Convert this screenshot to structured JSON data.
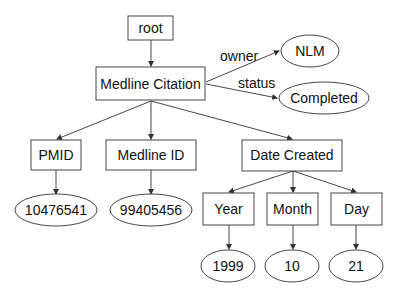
{
  "diagram": {
    "colors": {
      "stroke": "#333333",
      "text": "#111111",
      "background": "#ffffff"
    },
    "nodes": {
      "root": {
        "label": "root",
        "shape": "rect"
      },
      "medline_citation": {
        "label": "Medline Citation",
        "shape": "rect"
      },
      "nlm": {
        "label": "NLM",
        "shape": "ellipse"
      },
      "completed": {
        "label": "Completed",
        "shape": "ellipse"
      },
      "pmid": {
        "label": "PMID",
        "shape": "rect"
      },
      "medline_id": {
        "label": "Medline ID",
        "shape": "rect"
      },
      "date_created": {
        "label": "Date Created",
        "shape": "rect"
      },
      "pmid_value": {
        "label": "10476541",
        "shape": "ellipse"
      },
      "medline_id_value": {
        "label": "99405456",
        "shape": "ellipse"
      },
      "year": {
        "label": "Year",
        "shape": "rect"
      },
      "month": {
        "label": "Month",
        "shape": "rect"
      },
      "day": {
        "label": "Day",
        "shape": "rect"
      },
      "year_value": {
        "label": "1999",
        "shape": "ellipse"
      },
      "month_value": {
        "label": "10",
        "shape": "ellipse"
      },
      "day_value": {
        "label": "21",
        "shape": "ellipse"
      }
    },
    "edges": [
      {
        "from": "root",
        "to": "medline_citation",
        "label": ""
      },
      {
        "from": "medline_citation",
        "to": "nlm",
        "label": "owner"
      },
      {
        "from": "medline_citation",
        "to": "completed",
        "label": "status"
      },
      {
        "from": "medline_citation",
        "to": "pmid",
        "label": ""
      },
      {
        "from": "medline_citation",
        "to": "medline_id",
        "label": ""
      },
      {
        "from": "medline_citation",
        "to": "date_created",
        "label": ""
      },
      {
        "from": "pmid",
        "to": "pmid_value",
        "label": ""
      },
      {
        "from": "medline_id",
        "to": "medline_id_value",
        "label": ""
      },
      {
        "from": "date_created",
        "to": "year",
        "label": ""
      },
      {
        "from": "date_created",
        "to": "month",
        "label": ""
      },
      {
        "from": "date_created",
        "to": "day",
        "label": ""
      },
      {
        "from": "year",
        "to": "year_value",
        "label": ""
      },
      {
        "from": "month",
        "to": "month_value",
        "label": ""
      },
      {
        "from": "day",
        "to": "day_value",
        "label": ""
      }
    ],
    "edge_labels": {
      "owner": "owner",
      "status": "status"
    }
  }
}
